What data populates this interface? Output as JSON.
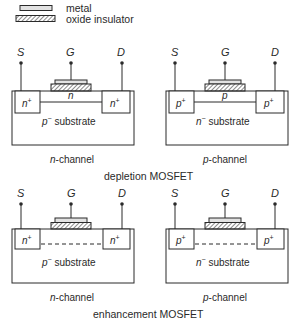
{
  "legend": {
    "metal_label": "metal",
    "oxide_label": "oxide insulator"
  },
  "terminals": {
    "source": "S",
    "gate": "G",
    "drain": "D"
  },
  "depletion": {
    "title": "depletion MOSFET",
    "n_device": {
      "caption_prefix": "n",
      "caption_suffix": "-channel",
      "well_left": "n",
      "well_right": "n",
      "well_sup": "+",
      "channel": "n",
      "substrate_prefix": "p",
      "substrate_sup": "−",
      "substrate_text": " substrate"
    },
    "p_device": {
      "caption_prefix": "p",
      "caption_suffix": "-channel",
      "well_left": "p",
      "well_right": "p",
      "well_sup": "+",
      "channel": "p",
      "substrate_prefix": "n",
      "substrate_sup": "−",
      "substrate_text": " substrate"
    }
  },
  "enhancement": {
    "title": "enhancement MOSFET",
    "n_device": {
      "caption_prefix": "n",
      "caption_suffix": "-channel",
      "well_left": "n",
      "well_right": "n",
      "well_sup": "+",
      "substrate_prefix": "p",
      "substrate_sup": "−",
      "substrate_text": " substrate"
    },
    "p_device": {
      "caption_prefix": "p",
      "caption_suffix": "-channel",
      "well_left": "p",
      "well_right": "p",
      "well_sup": "+",
      "substrate_prefix": "n",
      "substrate_sup": "−",
      "substrate_text": " substrate"
    }
  },
  "colors": {
    "line": "#2a2a2a",
    "metal_fill": "#e2e2e2",
    "oxide_fill": "#ffffff"
  }
}
